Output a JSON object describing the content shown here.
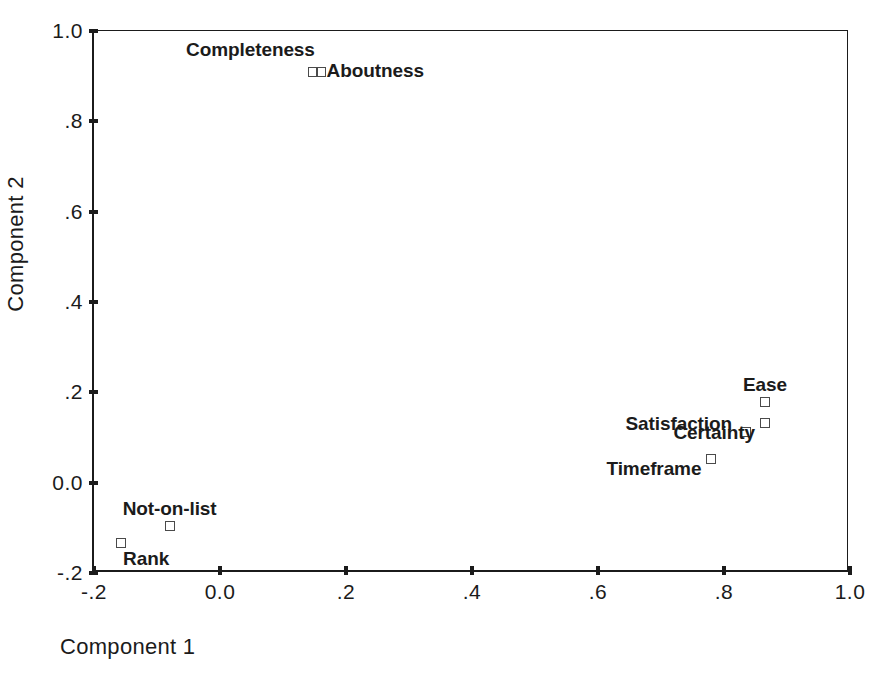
{
  "chart_data": {
    "type": "scatter",
    "title": "",
    "xlabel": "Component 1",
    "ylabel": "Component 2",
    "xlim": [
      -0.2,
      1.0
    ],
    "ylim": [
      -0.2,
      1.0
    ],
    "xticks": [
      "-.2",
      "0.0",
      ".2",
      ".4",
      ".6",
      ".8",
      "1.0"
    ],
    "xtick_values": [
      -0.2,
      0.0,
      0.2,
      0.4,
      0.6,
      0.8,
      1.0
    ],
    "yticks": [
      "-.2",
      "0.0",
      ".2",
      ".4",
      ".6",
      ".8",
      "1.0"
    ],
    "ytick_values": [
      -0.2,
      0.0,
      0.2,
      0.4,
      0.6,
      0.8,
      1.0
    ],
    "grid": false,
    "legend": "none",
    "marker_style": "open-square",
    "marker_color": "#4a4a4a",
    "axis_color": "#1b1b1b",
    "points": [
      {
        "label": "Aboutness",
        "x": 0.147,
        "y": 0.91,
        "label_pos": "right"
      },
      {
        "label": "Completeness",
        "x": 0.16,
        "y": 0.91,
        "label_pos": "upper-left"
      },
      {
        "label": "Ease",
        "x": 0.865,
        "y": 0.178,
        "label_pos": "above"
      },
      {
        "label": "Satisfaction",
        "x": 0.835,
        "y": 0.112,
        "label_pos": "left"
      },
      {
        "label": "Certainty",
        "x": 0.865,
        "y": 0.133,
        "label_pos": "lower-left"
      },
      {
        "label": "Timeframe",
        "x": 0.78,
        "y": 0.052,
        "label_pos": "lower-left"
      },
      {
        "label": "Not-on-list",
        "x": -0.08,
        "y": -0.095,
        "label_pos": "above"
      },
      {
        "label": "Rank",
        "x": -0.157,
        "y": -0.133,
        "label_pos": "below-right"
      }
    ]
  },
  "title_remnant": "Component Plot in Rotated Space"
}
